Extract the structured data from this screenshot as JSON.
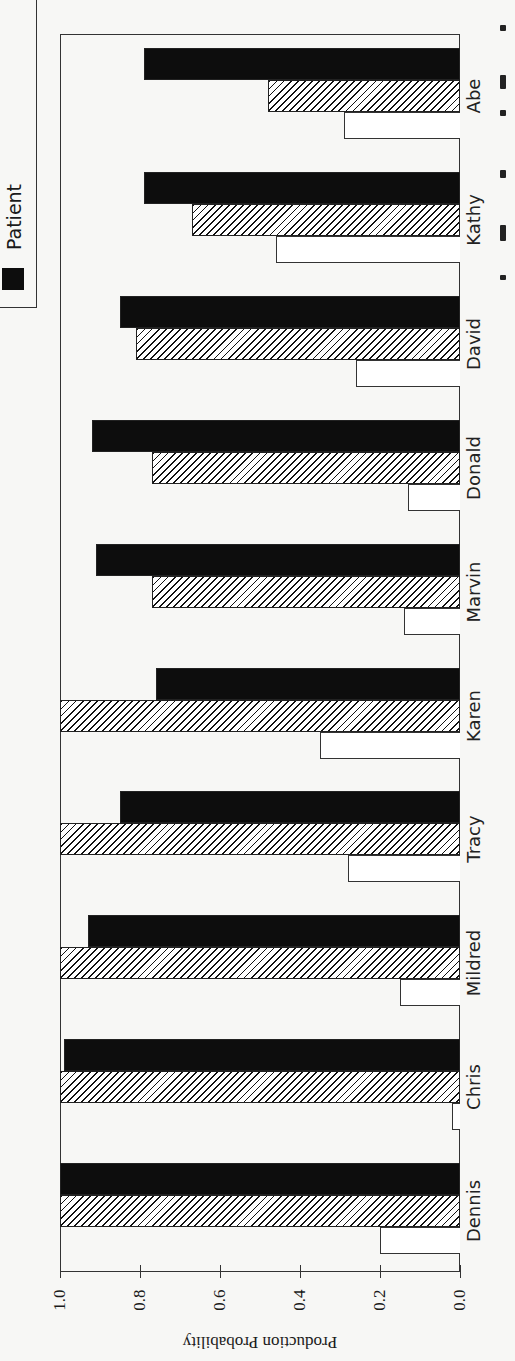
{
  "chart_data": {
    "type": "bar",
    "orientation": "rotated-90 (horizontal bars, value axis runs right-to-left)",
    "title": "",
    "xlabel": "",
    "ylabel": "Production Probability",
    "ylim": [
      0.0,
      1.0
    ],
    "yticks": [
      "1.0",
      "0.8",
      "0.6",
      "0.4",
      "0.2",
      "0.0"
    ],
    "categories": [
      "Dennis",
      "Chris",
      "Mildred",
      "Tracy",
      "Karen",
      "Marvin",
      "Donald",
      "David",
      "Kathy",
      "Abe"
    ],
    "series": [
      {
        "name": "Patient",
        "style": "solid-black",
        "values": [
          1.0,
          0.99,
          0.93,
          0.85,
          0.76,
          0.91,
          0.92,
          0.85,
          0.79,
          0.79
        ]
      },
      {
        "name": "(hatched series, legend label cropped)",
        "style": "diagonal-hatch",
        "values": [
          1.0,
          1.0,
          1.0,
          1.0,
          1.0,
          0.77,
          0.77,
          0.81,
          0.67,
          0.48
        ]
      },
      {
        "name": "(white series, legend label cropped)",
        "style": "white-outline",
        "values": [
          0.2,
          0.02,
          0.15,
          0.28,
          0.35,
          0.14,
          0.13,
          0.26,
          0.46,
          0.29
        ]
      }
    ],
    "legend": {
      "position": "top-left",
      "visible_entries": [
        "Patient"
      ]
    },
    "grid": false
  },
  "legend": {
    "label": "Patient"
  },
  "axis": {
    "title": "Production Probability"
  }
}
